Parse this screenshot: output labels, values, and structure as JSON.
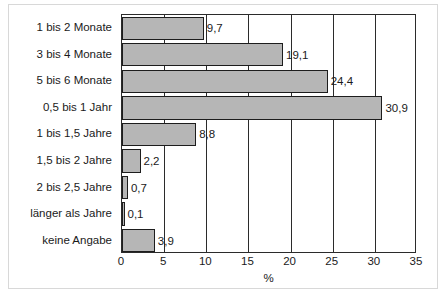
{
  "chart_data": {
    "type": "bar",
    "orientation": "horizontal",
    "title": "",
    "xlabel": "%",
    "ylabel": "",
    "xlim": [
      0,
      35
    ],
    "xticks": [
      "0",
      "5",
      "10",
      "15",
      "20",
      "25",
      "30",
      "35"
    ],
    "grid": true,
    "grid_axis": "x",
    "legend": "none",
    "categories": [
      "1 bis 2 Monate",
      "3 bis 4 Monate",
      "5 bis 6 Monate",
      "0,5 bis 1 Jahr",
      "1 bis 1,5 Jahre",
      "1,5 bis 2 Jahre",
      "2 bis 2,5 Jahre",
      "länger als Jahre",
      "keine Angabe"
    ],
    "values": [
      9.7,
      19.1,
      24.4,
      30.9,
      8.8,
      2.2,
      0.7,
      0.1,
      3.9
    ],
    "value_labels": [
      "9,7",
      "19,1",
      "24,4",
      "30,9",
      "8,8",
      "2,2",
      "0,7",
      "0,1",
      "3,9"
    ],
    "bar_color": "#b6b6b6",
    "bar_edge_color": "#1d1d1d",
    "axis_color": "#2b2b2b",
    "text_color": "#1a1a1a",
    "background_color": "#ffffff"
  }
}
